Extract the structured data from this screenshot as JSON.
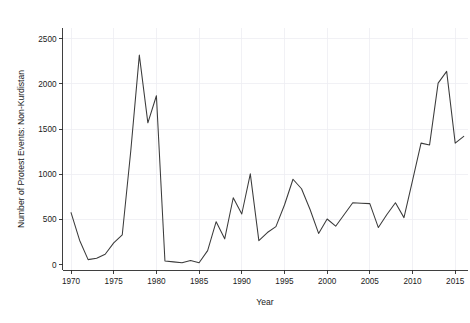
{
  "chart_data": {
    "type": "line",
    "title": "",
    "subtitle": "",
    "xlabel": "Year",
    "ylabel": "Number of Protest Events: Non-Kurdistan",
    "xlim": [
      1969,
      1966
    ],
    "x_axis_range": [
      1969.0,
      2016.5
    ],
    "ylim": [
      -60,
      2620
    ],
    "xticks": [
      1970,
      1975,
      1980,
      1985,
      1990,
      1995,
      2000,
      2005,
      2010,
      2015
    ],
    "xticklabels": [
      "1970",
      "1975",
      "1980",
      "1985",
      "1990",
      "1995",
      "2000",
      "2005",
      "2010",
      "2015"
    ],
    "yticks": [
      0,
      500,
      1000,
      1500,
      2000,
      2500
    ],
    "yticklabels": [
      "0",
      "500",
      "1000",
      "1500",
      "2000",
      "2500"
    ],
    "grid": true,
    "grid_color": "#ededf2",
    "legend": false,
    "legend_position": "none",
    "line_color": "#3b3b3b",
    "x": [
      1970,
      1971,
      1972,
      1973,
      1974,
      1975,
      1976,
      1977,
      1978,
      1979,
      1980,
      1981,
      1982,
      1983,
      1984,
      1985,
      1986,
      1987,
      1988,
      1989,
      1990,
      1991,
      1992,
      1993,
      1994,
      1995,
      1996,
      1997,
      1998,
      1999,
      2000,
      2001,
      2002,
      2003,
      2004,
      2005,
      2006,
      2007,
      2008,
      2009,
      2010,
      2011,
      2012,
      2013,
      2014,
      2015,
      2016
    ],
    "values": [
      575,
      270,
      55,
      70,
      115,
      240,
      330,
      1260,
      2320,
      1570,
      1870,
      40,
      30,
      20,
      45,
      20,
      155,
      475,
      285,
      740,
      560,
      1005,
      265,
      355,
      420,
      660,
      945,
      840,
      610,
      345,
      505,
      425,
      555,
      685,
      680,
      675,
      410,
      555,
      685,
      520,
      930,
      1345,
      1325,
      2010,
      2140,
      1345,
      1420
    ],
    "series": [
      {
        "name": "Non-Kurdistan protest events",
        "values": [
          575,
          270,
          55,
          70,
          115,
          240,
          330,
          1260,
          2320,
          1570,
          1870,
          40,
          30,
          20,
          45,
          20,
          155,
          475,
          285,
          740,
          560,
          1005,
          265,
          355,
          420,
          660,
          945,
          840,
          610,
          345,
          505,
          425,
          555,
          685,
          680,
          675,
          410,
          555,
          685,
          520,
          930,
          1345,
          1325,
          2010,
          2140,
          1345,
          1420
        ]
      }
    ],
    "annotations": []
  }
}
